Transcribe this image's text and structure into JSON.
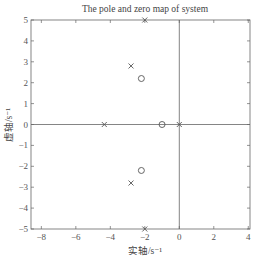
{
  "chart_data": {
    "type": "scatter",
    "title": "The pole and zero map of system",
    "xlabel": "实轴/s⁻¹",
    "ylabel": "虚轴/s⁻¹",
    "xlim": [
      -8.6,
      4.1
    ],
    "ylim": [
      -5,
      5
    ],
    "xticks": [
      -8,
      -6,
      -4,
      -2,
      0,
      2,
      4
    ],
    "yticks": [
      -5,
      -4,
      -3,
      -2,
      -1,
      0,
      1,
      2,
      3,
      4,
      5
    ],
    "grid": false,
    "legend": null,
    "reference_lines": {
      "x": 0,
      "y": 0
    },
    "series": [
      {
        "name": "poles",
        "marker": "x",
        "points": [
          {
            "x": -2.0,
            "y": 5.0
          },
          {
            "x": -2.8,
            "y": 2.8
          },
          {
            "x": -4.35,
            "y": 0
          },
          {
            "x": 0,
            "y": 0
          },
          {
            "x": -2.8,
            "y": -2.8
          },
          {
            "x": -2.0,
            "y": -5.0
          }
        ]
      },
      {
        "name": "zeros",
        "marker": "o",
        "points": [
          {
            "x": -2.2,
            "y": 2.2
          },
          {
            "x": -1.0,
            "y": 0
          },
          {
            "x": -2.2,
            "y": -2.2
          }
        ]
      }
    ]
  }
}
